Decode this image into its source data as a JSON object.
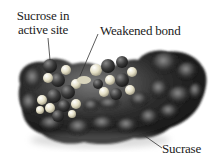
{
  "figure": {
    "labels": {
      "sucrose_line1": "Sucrose in",
      "sucrose_line2": "active site",
      "weakened_bond": "Weakened bond",
      "sucrase": "Sucrase"
    },
    "colors": {
      "enzyme_dark": "#1e1e1e",
      "enzyme_mid": "#4a4a4a",
      "enzyme_highlight": "#9a9a9a",
      "substrate_dark": "#3a3a3a",
      "substrate_light": "#e6e2cc",
      "leader_line": "#333333",
      "text": "#222222",
      "background": "#ffffff"
    }
  }
}
